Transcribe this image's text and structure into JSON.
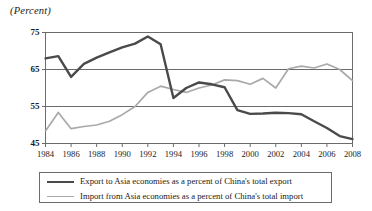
{
  "chart_data": {
    "type": "line",
    "title": "(Percent)",
    "xlabel": "",
    "ylabel": "",
    "ylim": [
      45,
      75
    ],
    "xlim": [
      1984,
      2008
    ],
    "yticks": [
      45,
      55,
      65,
      75
    ],
    "xticks": [
      1984,
      1986,
      1988,
      1990,
      1992,
      1994,
      1996,
      1998,
      2000,
      2002,
      2004,
      2006,
      2008
    ],
    "grid": "horizontal-at-55-and-65",
    "legend_position": "below-plot",
    "x": [
      1984,
      1985,
      1986,
      1987,
      1988,
      1989,
      1990,
      1991,
      1992,
      1993,
      1994,
      1995,
      1996,
      1997,
      1998,
      1999,
      2000,
      2001,
      2002,
      2003,
      2004,
      2005,
      2006,
      2007,
      2008
    ],
    "series": [
      {
        "name": "Export to Asia economies as a percent of China's total export",
        "color": "#4a4a4a",
        "values": [
          68.0,
          68.6,
          63.0,
          66.5,
          68.2,
          69.6,
          71.0,
          72.0,
          73.9,
          71.8,
          57.3,
          60.0,
          61.5,
          61.0,
          60.2,
          54.0,
          53.0,
          53.1,
          53.3,
          53.2,
          52.9,
          51.0,
          49.2,
          47.0,
          46.2
        ]
      },
      {
        "name": "Import from Asia economies as a percent of China's total import",
        "color": "#a9a9a9",
        "values": [
          48.4,
          53.4,
          49.0,
          49.6,
          50.0,
          51.0,
          52.8,
          55.0,
          58.8,
          60.5,
          59.6,
          58.8,
          60.0,
          60.8,
          62.2,
          62.0,
          61.0,
          62.6,
          60.0,
          65.2,
          65.9,
          65.4,
          66.5,
          65.0,
          62.0
        ]
      }
    ]
  },
  "legend": {
    "items": [
      {
        "label": "Export to Asia economies as a percent of China's total export"
      },
      {
        "label": "Import from Asia economies as a percent of China's total import"
      }
    ]
  },
  "axis": {
    "unit_label": "(Percent)",
    "y_tick_labels": [
      "75",
      "65",
      "55",
      "45"
    ],
    "x_tick_labels": [
      "1984",
      "1986",
      "1988",
      "1990",
      "1992",
      "1994",
      "1996",
      "1998",
      "2000",
      "2002",
      "2004",
      "2006",
      "2008"
    ]
  },
  "colors": {
    "export_line": "#4a4a4a",
    "import_line": "#a9a9a9",
    "frame": "#6b6b6b",
    "gridline": "#6b6b6b",
    "background": "#ffffff"
  }
}
